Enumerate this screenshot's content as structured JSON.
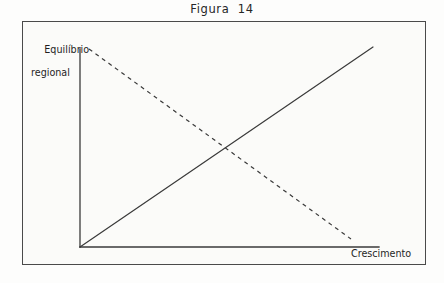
{
  "figure": {
    "title": "Figura  14",
    "background_color": "#fdfdfc",
    "frame_color": "#4a4a4a",
    "ink_color": "#3a3a3a"
  },
  "labels": {
    "y_axis_line1": "Equilíbrio",
    "y_axis_line2": "regional",
    "x_axis": "Crescimento"
  },
  "chart_data": {
    "type": "line",
    "title": "Figura  14",
    "xlabel": "Crescimento",
    "ylabel": "Equilíbrio regional",
    "grid": false,
    "legend": "none",
    "xlim": [
      0,
      1
    ],
    "ylim": [
      0,
      1
    ],
    "axis_ticks": {
      "x": [],
      "y": []
    },
    "series": [
      {
        "name": "Relação crescente",
        "style": "solid",
        "color": "#3a3a3a",
        "x": [
          0,
          1
        ],
        "y": [
          0,
          1
        ],
        "points_px": [
          [
            57,
            225
          ],
          [
            350,
            25
          ]
        ]
      },
      {
        "name": "Relação decrescente",
        "style": "dashed",
        "color": "#3a3a3a",
        "x": [
          0,
          1
        ],
        "y": [
          1,
          0
        ],
        "points_px": [
          [
            66,
            27
          ],
          [
            328,
            217
          ]
        ]
      }
    ],
    "intersection": {
      "x": 0.5,
      "y": 0.5,
      "point_px": [
        201,
        125
      ]
    },
    "annotations": []
  },
  "geometry": {
    "frame_px": {
      "x": 22,
      "y": 21,
      "width": 404,
      "height": 244
    },
    "origin_px": {
      "x": 57,
      "y": 225
    },
    "y_axis_top_px": {
      "x": 57,
      "y": 27
    },
    "x_axis_right_px": {
      "x": 356,
      "y": 225
    }
  }
}
